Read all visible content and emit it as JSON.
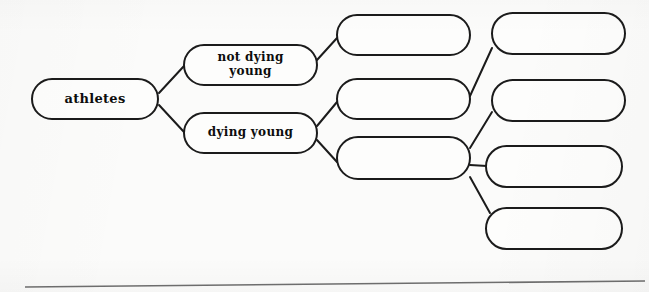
{
  "diagram": {
    "type": "hierarchy-tree",
    "background_color": "#fbfbfa",
    "stroke_color": "#1b1b1b",
    "node_fill_color": "#fdfdfc",
    "divider_color": "#6f6f6f",
    "nodes": [
      {
        "id": "athletes",
        "label": "athletes",
        "column": 1,
        "x": 31,
        "y": 78,
        "w": 128,
        "h": 42,
        "font_size": 13,
        "empty": false
      },
      {
        "id": "not-dying-young",
        "label": "not dying\nyoung",
        "column": 2,
        "x": 183,
        "y": 44,
        "w": 135,
        "h": 42,
        "font_size": 12,
        "empty": false
      },
      {
        "id": "dying-young",
        "label": "dying young",
        "column": 2,
        "x": 183,
        "y": 112,
        "w": 135,
        "h": 42,
        "font_size": 12,
        "empty": false
      },
      {
        "id": "mid-1",
        "label": "",
        "column": 3,
        "x": 336,
        "y": 14,
        "w": 135,
        "h": 42,
        "font_size": 12,
        "empty": true
      },
      {
        "id": "mid-2",
        "label": "",
        "column": 3,
        "x": 336,
        "y": 78,
        "w": 135,
        "h": 42,
        "font_size": 12,
        "empty": true
      },
      {
        "id": "mid-3",
        "label": "",
        "column": 3,
        "x": 336,
        "y": 136,
        "w": 135,
        "h": 44,
        "font_size": 12,
        "empty": true
      },
      {
        "id": "right-1",
        "label": "",
        "column": 4,
        "x": 491,
        "y": 12,
        "w": 135,
        "h": 43,
        "font_size": 12,
        "empty": true
      },
      {
        "id": "right-2",
        "label": "",
        "column": 4,
        "x": 491,
        "y": 79,
        "w": 135,
        "h": 43,
        "font_size": 12,
        "empty": true
      },
      {
        "id": "right-3",
        "label": "",
        "column": 4,
        "x": 485,
        "y": 145,
        "w": 138,
        "h": 43,
        "font_size": 12,
        "empty": true
      },
      {
        "id": "right-4",
        "label": "",
        "column": 4,
        "x": 485,
        "y": 207,
        "w": 138,
        "h": 43,
        "font_size": 12,
        "empty": true
      }
    ],
    "edges": [
      {
        "id": "e-athletes-not-dying",
        "from": "athletes",
        "to": "not-dying-young",
        "x1": 159,
        "y1": 93,
        "x2": 184,
        "y2": 66
      },
      {
        "id": "e-athletes-dying",
        "from": "athletes",
        "to": "dying-young",
        "x1": 159,
        "y1": 105,
        "x2": 184,
        "y2": 132
      },
      {
        "id": "e-not-dying-mid1",
        "from": "not-dying-young",
        "to": "mid-1",
        "x1": 317,
        "y1": 60,
        "x2": 337,
        "y2": 38
      },
      {
        "id": "e-dying-mid2",
        "from": "dying-young",
        "to": "mid-2",
        "x1": 317,
        "y1": 126,
        "x2": 337,
        "y2": 102
      },
      {
        "id": "e-dying-mid3",
        "from": "dying-young",
        "to": "mid-3",
        "x1": 317,
        "y1": 140,
        "x2": 337,
        "y2": 162
      },
      {
        "id": "e-mid2-right1",
        "from": "mid-2",
        "to": "right-1",
        "x1": 470,
        "y1": 96,
        "x2": 492,
        "y2": 48
      },
      {
        "id": "e-mid3-right2",
        "from": "mid-3",
        "to": "right-2",
        "x1": 470,
        "y1": 148,
        "x2": 492,
        "y2": 112
      },
      {
        "id": "e-mid3-right3",
        "from": "mid-3",
        "to": "right-3",
        "x1": 470,
        "y1": 165,
        "x2": 487,
        "y2": 166
      },
      {
        "id": "e-mid3-right4",
        "from": "mid-3",
        "to": "right-4",
        "x1": 470,
        "y1": 177,
        "x2": 490,
        "y2": 213
      }
    ],
    "divider": {
      "id": "bottom-divider",
      "x1": 25,
      "y1": 287,
      "x2": 645,
      "y2": 281
    }
  }
}
